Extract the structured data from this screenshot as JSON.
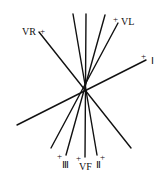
{
  "diagram": {
    "title": "",
    "center": {
      "x": 85,
      "y": 88
    },
    "lines": [
      {
        "id": "top-left-vertical",
        "x1": 73,
        "y1": 14,
        "x2": 97,
        "y2": 155,
        "label": "Ⅱ",
        "plus_end": "bottom"
      },
      {
        "id": "top-vertical",
        "x1": 86,
        "y1": 14,
        "x2": 85,
        "y2": 157,
        "label": "VF",
        "plus_end": "bottom"
      },
      {
        "id": "top-right",
        "x1": 105,
        "y1": 15,
        "x2": 66,
        "y2": 155,
        "label": "Ⅲ",
        "plus_end": "bottom"
      },
      {
        "id": "vl-line",
        "x1": 118,
        "y1": 23,
        "x2": 51,
        "y2": 148,
        "label": "VL",
        "plus_end": "top"
      },
      {
        "id": "vr-line",
        "x1": 39,
        "y1": 32,
        "x2": 131,
        "y2": 148,
        "label": "VR",
        "plus_end": "top"
      },
      {
        "id": "lead-i-line",
        "x1": 17,
        "y1": 125,
        "x2": 146,
        "y2": 60,
        "label": "Ⅰ",
        "plus_end": "right"
      }
    ],
    "labels": [
      {
        "text": "VR",
        "x": 22,
        "y": 35
      },
      {
        "text": "VL",
        "x": 121,
        "y": 25
      },
      {
        "text": "Ⅰ",
        "x": 151,
        "y": 64
      },
      {
        "text": "Ⅲ",
        "x": 62,
        "y": 168
      },
      {
        "text": "VF",
        "x": 79,
        "y": 170
      },
      {
        "text": "Ⅱ",
        "x": 96,
        "y": 168
      }
    ],
    "plus_signs": [
      {
        "x": 40,
        "y": 34
      },
      {
        "x": 113,
        "y": 22
      },
      {
        "x": 141,
        "y": 59
      },
      {
        "x": 57,
        "y": 159
      },
      {
        "x": 76,
        "y": 161
      },
      {
        "x": 100,
        "y": 160
      }
    ],
    "plus_symbol": "+"
  }
}
